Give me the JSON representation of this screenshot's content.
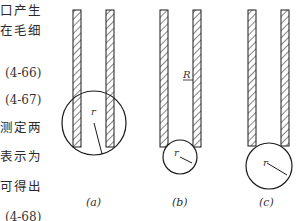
{
  "text_fragment": {
    "lines": [
      {
        "text": "口产生",
        "y": 4
      },
      {
        "text": "在毛细",
        "y": 24
      },
      {
        "text": "(4-66)",
        "y": 66,
        "kind": "equation"
      },
      {
        "text": "(4-67)",
        "y": 93,
        "kind": "equation"
      },
      {
        "text": "测定两",
        "y": 121
      },
      {
        "text": "表示为",
        "y": 150
      },
      {
        "text": "可得出",
        "y": 180
      },
      {
        "text": "(4-68)",
        "y": 210,
        "kind": "equation"
      }
    ]
  },
  "figure": {
    "panels": [
      {
        "id": "a",
        "caption": "(a)",
        "radius_label": "r",
        "tube_label": ""
      },
      {
        "id": "b",
        "caption": "(b)",
        "radius_label": "r",
        "tube_label": "R"
      },
      {
        "id": "c",
        "caption": "(c)",
        "radius_label": "r",
        "tube_label": ""
      }
    ],
    "colors": {
      "stroke": "#1a1a1a",
      "hatch": "#333333",
      "background": "#ffffff"
    }
  }
}
